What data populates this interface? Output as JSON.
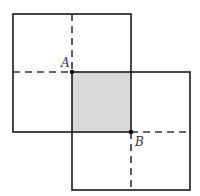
{
  "diagram": {
    "colors": {
      "stroke": "#1a1a1a",
      "shade": "#d9d9d9",
      "dash": "#333333"
    },
    "square1": {
      "x": 13,
      "y": 14,
      "size": 118
    },
    "square2": {
      "x": 72,
      "y": 72,
      "size": 118
    },
    "overlap": {
      "x": 72,
      "y": 72,
      "w": 59,
      "h": 60
    },
    "points": [
      {
        "label": "A",
        "x": 72,
        "y": 72,
        "label_x": 61,
        "label_y": 66
      },
      {
        "label": "B",
        "x": 131,
        "y": 132,
        "label_x": 134,
        "label_y": 145
      }
    ]
  }
}
